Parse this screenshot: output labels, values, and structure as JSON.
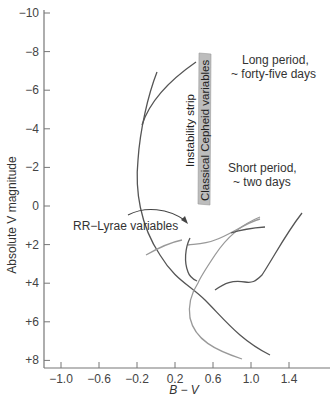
{
  "chart_data": {
    "type": "line",
    "title": "",
    "xlabel": "B − V",
    "ylabel": "Absolute V magnitude",
    "xlim": [
      -1.2,
      1.8
    ],
    "ylim": [
      8.5,
      -10
    ],
    "y_inverted": true,
    "grid": false,
    "x_ticks": [
      -1.0,
      -0.6,
      -0.2,
      0.2,
      0.6,
      1.0,
      1.4
    ],
    "x_tick_labels": [
      "−1.0",
      "−0.6",
      "−0.2",
      "0.2",
      "0.6",
      "1.0",
      "1.4"
    ],
    "y_ticks": [
      -10,
      -8,
      -6,
      -4,
      -2,
      0,
      2,
      4,
      6,
      8
    ],
    "y_tick_labels": [
      "−10",
      "−8",
      "−6",
      "−4",
      "−2",
      "0",
      "+2",
      "+4",
      "+6",
      "+8"
    ],
    "series": [
      {
        "name": "Evolutionary track A (dark)",
        "color": "#555555",
        "points": [
          [
            0.01,
            -6.9
          ],
          [
            -0.05,
            -5.0
          ],
          [
            -0.1,
            -3.0
          ],
          [
            -0.06,
            -1.0
          ],
          [
            0.06,
            1.0
          ],
          [
            0.3,
            3.0
          ],
          [
            0.55,
            4.4
          ],
          [
            0.8,
            6.0
          ],
          [
            1.0,
            7.2
          ],
          [
            1.25,
            8.0
          ]
        ]
      },
      {
        "name": "Evolutionary track B (dark)",
        "color": "#555555",
        "points": [
          [
            0.43,
            -7.5
          ],
          [
            0.2,
            -6.4
          ],
          [
            0.0,
            -5.3
          ],
          [
            -0.1,
            -4.2
          ]
        ]
      },
      {
        "name": "Long-period Cepheid loop (dark)",
        "color": "#555555",
        "points": [
          [
            1.5,
            -1.0
          ],
          [
            1.3,
            0.7
          ],
          [
            1.1,
            2.3
          ],
          [
            0.98,
            4.0
          ],
          [
            0.8,
            4.2
          ],
          [
            0.62,
            4.8
          ],
          [
            0.56,
            5.4
          ]
        ]
      },
      {
        "name": "Short-period loop (gray)",
        "color": "#999999",
        "points": [
          [
            1.42,
            -1.4
          ],
          [
            1.1,
            -0.9
          ],
          [
            0.8,
            0.0
          ],
          [
            0.62,
            0.8
          ],
          [
            0.42,
            1.1
          ]
        ]
      },
      {
        "name": "Short-period loop upper (gray)",
        "color": "#999999",
        "points": [
          [
            1.4,
            -1.5
          ],
          [
            1.1,
            -0.6
          ],
          [
            0.88,
            0.8
          ],
          [
            0.76,
            2.5
          ],
          [
            0.68,
            3.6
          ],
          [
            0.52,
            4.2
          ],
          [
            0.43,
            6.0
          ],
          [
            0.6,
            7.2
          ],
          [
            0.95,
            8.2
          ]
        ]
      },
      {
        "name": "Dark short segment",
        "color": "#555555",
        "points": [
          [
            0.7,
            0.4
          ],
          [
            1.05,
            -0.1
          ]
        ]
      },
      {
        "name": "RR Lyrae hook (dark)",
        "color": "#555555",
        "points": [
          [
            0.34,
            1.4
          ],
          [
            0.28,
            2.2
          ],
          [
            0.3,
            3.0
          ],
          [
            0.4,
            3.5
          ]
        ]
      },
      {
        "name": "Horizontal branch (gray)",
        "color": "#999999",
        "points": [
          [
            -0.1,
            2.6
          ],
          [
            0.05,
            2.0
          ],
          [
            0.25,
            1.5
          ]
        ]
      },
      {
        "name": "RR Lyrae pointer",
        "color": "#444444",
        "points": [
          [
            -0.1,
            1.1
          ],
          [
            0.1,
            0.55
          ],
          [
            0.3,
            0.7
          ],
          [
            0.42,
            1.1
          ]
        ]
      }
    ],
    "regions": [
      {
        "name": "Instability strip / Classical Cepheid variables",
        "type": "shaded_band",
        "color": "#bdbdbd",
        "corners": [
          [
            0.45,
            -7.9
          ],
          [
            0.57,
            -7.9
          ],
          [
            0.56,
            0.1
          ],
          [
            0.44,
            0.1
          ]
        ]
      }
    ],
    "annotations": [
      {
        "text": "Instability strip",
        "rotation": -90
      },
      {
        "text": "Classical Cepheid variables",
        "rotation": -90
      },
      {
        "text": "Long period,",
        "x": 0.82,
        "y": -6.3
      },
      {
        "text": "~ forty-five days",
        "x": 0.78,
        "y": -5.2
      },
      {
        "text": "Short period,",
        "x": 0.74,
        "y": -1.2
      },
      {
        "text": "~ two days",
        "x": 0.78,
        "y": -0.1
      },
      {
        "text": "RR−Lyrae variables",
        "x": -0.7,
        "y": 1.2
      }
    ]
  },
  "labels": {
    "y_axis_title": "Absolute V magnitude",
    "x_axis_title": "B − V",
    "strip_label_1": "Instability strip",
    "strip_label_2": "Classical Cepheid variables",
    "long_period_1": "Long period,",
    "long_period_2": "~ forty-five days",
    "short_period_1": "Short period,",
    "short_period_2": "~ two days",
    "rr_lyrae": "RR−Lyrae variables"
  }
}
